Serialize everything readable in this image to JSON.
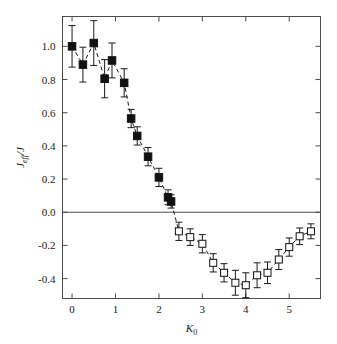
{
  "figure": {
    "background_color": "#ffffff",
    "frame_color": "#4d4d4d",
    "marker_color": "#111111"
  },
  "chart_data": {
    "type": "scatter",
    "title": "",
    "subtitle": "",
    "xlabel": "K_0",
    "xlabel_base": "K",
    "xlabel_sub": "0",
    "ylabel": "J_eff/J",
    "ylabel_base": "J",
    "ylabel_sub": "eff",
    "ylabel_tail": "/J",
    "xlim": [
      -0.22,
      5.72
    ],
    "ylim": [
      -0.52,
      1.18
    ],
    "grid": false,
    "legend": "none",
    "zero_line": 0.0,
    "xticks": [
      0,
      1,
      2,
      3,
      4,
      5
    ],
    "xtick_labels": [
      "0",
      "1",
      "2",
      "3",
      "4",
      "5"
    ],
    "yticks": [
      -0.4,
      -0.2,
      0.0,
      0.2,
      0.4,
      0.6,
      0.8,
      1.0
    ],
    "ytick_labels": [
      "-0.4",
      "-0.2",
      "0.0",
      "0.2",
      "0.4",
      "0.6",
      "0.8",
      "1.0"
    ],
    "series": [
      {
        "name": "positive-branch",
        "marker": "filled-square",
        "points": [
          {
            "x": 0.0,
            "y": 1.0,
            "yerr": 0.125
          },
          {
            "x": 0.25,
            "y": 0.89,
            "yerr": 0.105
          },
          {
            "x": 0.5,
            "y": 1.02,
            "yerr": 0.135
          },
          {
            "x": 0.75,
            "y": 0.805,
            "yerr": 0.115
          },
          {
            "x": 0.92,
            "y": 0.915,
            "yerr": 0.105
          },
          {
            "x": 1.2,
            "y": 0.78,
            "yerr": 0.085
          },
          {
            "x": 1.36,
            "y": 0.565,
            "yerr": 0.055
          },
          {
            "x": 1.5,
            "y": 0.46,
            "yerr": 0.055
          },
          {
            "x": 1.75,
            "y": 0.335,
            "yerr": 0.055
          },
          {
            "x": 2.0,
            "y": 0.21,
            "yerr": 0.055
          },
          {
            "x": 2.21,
            "y": 0.09,
            "yerr": 0.045
          },
          {
            "x": 2.28,
            "y": 0.065,
            "yerr": 0.04
          }
        ]
      },
      {
        "name": "negative-branch",
        "marker": "open-square",
        "points": [
          {
            "x": 2.46,
            "y": -0.115,
            "yerr": 0.055
          },
          {
            "x": 2.72,
            "y": -0.15,
            "yerr": 0.05
          },
          {
            "x": 3.0,
            "y": -0.19,
            "yerr": 0.055
          },
          {
            "x": 3.25,
            "y": -0.305,
            "yerr": 0.055
          },
          {
            "x": 3.5,
            "y": -0.365,
            "yerr": 0.055
          },
          {
            "x": 3.76,
            "y": -0.425,
            "yerr": 0.075
          },
          {
            "x": 4.0,
            "y": -0.44,
            "yerr": 0.075
          },
          {
            "x": 4.26,
            "y": -0.38,
            "yerr": 0.075
          },
          {
            "x": 4.5,
            "y": -0.365,
            "yerr": 0.065
          },
          {
            "x": 4.76,
            "y": -0.285,
            "yerr": 0.06
          },
          {
            "x": 5.0,
            "y": -0.21,
            "yerr": 0.055
          },
          {
            "x": 5.24,
            "y": -0.145,
            "yerr": 0.05
          },
          {
            "x": 5.5,
            "y": -0.115,
            "yerr": 0.045
          }
        ]
      }
    ],
    "connector": {
      "style": "dashed",
      "description": "dashed guide line through all points"
    }
  }
}
